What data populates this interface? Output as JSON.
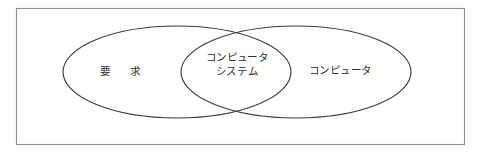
{
  "figure": {
    "kind": "venn-diagram",
    "title": "",
    "background_color": "#fdfdfd",
    "frame": {
      "name": "outer-frame",
      "x": 16,
      "y": 8,
      "width": 449,
      "height": 137,
      "stroke_color": "#8e8e8e"
    },
    "stroke_color": "#3c3c3c",
    "text_color": "#2e2e2e"
  },
  "sets": {
    "left": {
      "label": "要　求",
      "cx": 177,
      "cy": 72,
      "rx": 114,
      "ry": 46
    },
    "right": {
      "label": "コンピュータ",
      "cx": 296,
      "cy": 72,
      "rx": 115,
      "ry": 46
    },
    "intersection": {
      "label_line1": "コンピュータ",
      "label_line2": "システム",
      "top_point_x": 238,
      "top_point_y": 33,
      "bottom_point_x": 237,
      "bottom_point_y": 122
    }
  }
}
